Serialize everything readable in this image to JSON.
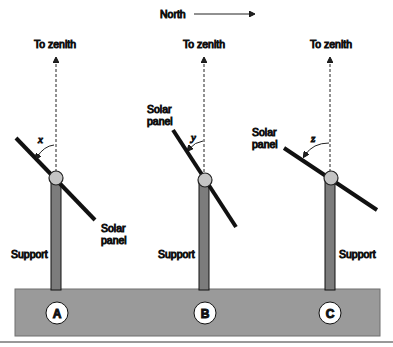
{
  "direction_label": "North",
  "colors": {
    "base": "#9a9a9a",
    "post": "#7c7c7c",
    "panel": "#111111",
    "pivot": "#c4c4c4",
    "line": "#222222"
  },
  "setups": [
    {
      "id": "A",
      "zenith_label": "To zenith",
      "angle_label": "x",
      "panel_label_line1": "Solar",
      "panel_label_line2": "panel",
      "support_label": "Support"
    },
    {
      "id": "B",
      "zenith_label": "To zenith",
      "angle_label": "y",
      "panel_label_line1": "Solar",
      "panel_label_line2": "panel",
      "support_label": "Support"
    },
    {
      "id": "C",
      "zenith_label": "To zenith",
      "angle_label": "z",
      "panel_label_line1": "Solar",
      "panel_label_line2": "panel",
      "support_label": "Support"
    }
  ]
}
